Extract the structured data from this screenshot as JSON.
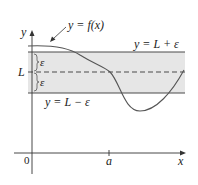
{
  "diagram": {
    "labels": {
      "curve": "y = f(x)",
      "upper_line": "y = L + ε",
      "lower_line": "y = L − ε",
      "L": "L",
      "epsilon_top": "ε",
      "epsilon_bottom": "ε",
      "origin": "0",
      "a": "a",
      "x_axis": "x",
      "y_axis": "y"
    },
    "colors": {
      "band_fill": "#e6e6e6",
      "lines": "#4a4a4a",
      "curve": "#555555",
      "axes": "#333333"
    }
  }
}
